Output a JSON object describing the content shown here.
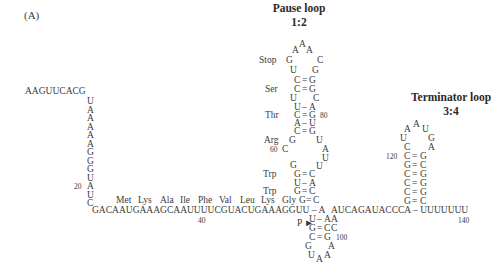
{
  "panel_label": "(A)",
  "pause_loop": {
    "title": "Pause loop",
    "pairing": "1:2"
  },
  "terminator_loop": {
    "title": "Terminator loop",
    "pairing": "3:4"
  },
  "leader": {
    "five_prime": "AAGUUCACG",
    "vertical": [
      "U",
      "A",
      "A",
      "A",
      "A",
      "A",
      "G",
      "G",
      "G",
      "U",
      "A",
      "U",
      "C"
    ],
    "pos_label_20": "20"
  },
  "bottom_row": {
    "seq_left": "GACAAUGAAAGCAAUUUUCGUACUGAAAGGUU – A",
    "seq_right": "AUCAGAUACCCA – UUUUUUU",
    "pos_40": "40",
    "pos_140": "140"
  },
  "amino_acids": [
    "Met",
    "Lys",
    "Ala",
    "Ile",
    "Phe",
    "Val",
    "Leu",
    "Lys",
    "Gly"
  ],
  "pause_stem": {
    "loop": [
      "A",
      "A",
      "A"
    ],
    "rows": [
      {
        "left": "G",
        "right": "C",
        "label": "Stop"
      },
      {
        "left": "U",
        "right": "G"
      },
      {
        "left": "C",
        "pair": "=",
        "right": "G"
      },
      {
        "left": "C",
        "pair": "=",
        "right": "G",
        "label": "Ser"
      },
      {
        "left": "U",
        "right": "C"
      },
      {
        "left": "U",
        "pair": "–",
        "right": "A"
      },
      {
        "left": "C",
        "pair": "=",
        "right": "G",
        "label": "Thr",
        "num": "80"
      },
      {
        "left": "A",
        "pair": "–",
        "right": "U"
      },
      {
        "left": "C",
        "pair": "=",
        "right": "G"
      },
      {
        "left": "G",
        "right": "U",
        "label": "Arg"
      },
      {
        "left": "C",
        "right": "A",
        "num_left": "60"
      },
      {
        "right": "U"
      },
      {
        "left": "G",
        "right": "U"
      },
      {
        "left": "G",
        "pair": "=",
        "right": "C",
        "label": "Trp"
      },
      {
        "left": "U",
        "pair": "–",
        "right": "A"
      },
      {
        "left": "G",
        "pair": "=",
        "right": "C",
        "label": "Trp"
      },
      {
        "left": "G",
        "pair": "=",
        "right": "C"
      }
    ]
  },
  "lower_hairpin": {
    "marker": "P ►",
    "rows": [
      {
        "left": "U",
        "pair": "–",
        "right": "A"
      },
      {
        "left": "G",
        "pair": "=",
        "right": "C"
      },
      {
        "left": "C",
        "pair": "=",
        "right": "G",
        "num": "100"
      },
      {
        "left": "G",
        "right": "A"
      }
    ],
    "loop": [
      "U",
      "A",
      "A"
    ]
  },
  "terminator_stem": {
    "loop": [
      "A",
      "A",
      "U"
    ],
    "rows": [
      {
        "left": "U",
        "right": "G"
      },
      {
        "left": "C",
        "right": "A"
      },
      {
        "left": "C",
        "pair": "=",
        "right": "G",
        "num_left": "120"
      },
      {
        "left": "G",
        "pair": "=",
        "right": "C"
      },
      {
        "left": "C",
        "pair": "=",
        "right": "G"
      },
      {
        "left": "C",
        "pair": "=",
        "right": "G"
      },
      {
        "left": "C",
        "pair": "=",
        "right": "G"
      },
      {
        "left": "G",
        "pair": "=",
        "right": "C"
      }
    ]
  },
  "bottom_extra": [
    "A",
    "C"
  ]
}
